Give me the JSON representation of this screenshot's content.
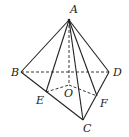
{
  "diagram": {
    "type": "pyramid",
    "points": {
      "A": {
        "label": "A",
        "x": 69,
        "y": 20,
        "lx": 70,
        "ly": 13
      },
      "B": {
        "label": "B",
        "x": 21,
        "y": 72,
        "lx": 11,
        "ly": 76
      },
      "C": {
        "label": "C",
        "x": 83,
        "y": 120,
        "lx": 83,
        "ly": 132
      },
      "D": {
        "label": "D",
        "x": 109,
        "y": 72,
        "lx": 113,
        "ly": 76
      },
      "E": {
        "label": "E",
        "x": 46,
        "y": 92,
        "lx": 36,
        "ly": 104
      },
      "F": {
        "label": "F",
        "x": 97,
        "y": 96,
        "lx": 100,
        "ly": 107
      },
      "O": {
        "label": "O",
        "x": 69,
        "y": 85,
        "lx": 64,
        "ly": 97
      }
    },
    "solid_edges": [
      [
        "A",
        "B"
      ],
      [
        "A",
        "D"
      ],
      [
        "A",
        "C"
      ],
      [
        "A",
        "E"
      ],
      [
        "A",
        "F"
      ],
      [
        "B",
        "C"
      ],
      [
        "C",
        "D"
      ]
    ],
    "dashed_edges": [
      [
        "B",
        "D"
      ],
      [
        "A",
        "O"
      ],
      [
        "E",
        "O"
      ],
      [
        "O",
        "F"
      ]
    ],
    "line_color": "#222222"
  }
}
